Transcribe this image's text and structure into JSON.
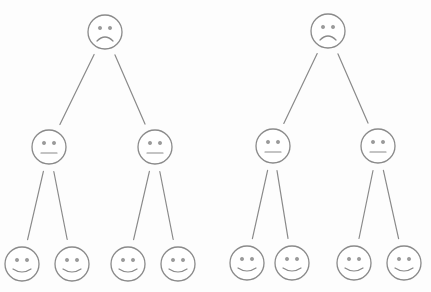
{
  "diagram": {
    "type": "tree",
    "colors": {
      "stroke": "#8a8a8a",
      "background": "#fdfdfd"
    },
    "face_radius": 17,
    "trees": [
      {
        "root": {
          "expression": "sad",
          "x": 105,
          "y": 32
        },
        "children": [
          {
            "expression": "neutral",
            "x": 49,
            "y": 147,
            "children": [
              {
                "expression": "happy",
                "x": 22,
                "y": 264
              },
              {
                "expression": "happy",
                "x": 72,
                "y": 264
              }
            ]
          },
          {
            "expression": "neutral",
            "x": 155,
            "y": 147,
            "children": [
              {
                "expression": "happy",
                "x": 128,
                "y": 264
              },
              {
                "expression": "happy",
                "x": 178,
                "y": 264
              }
            ]
          }
        ]
      },
      {
        "root": {
          "expression": "sad",
          "x": 328,
          "y": 31
        },
        "children": [
          {
            "expression": "neutral",
            "x": 273,
            "y": 146,
            "children": [
              {
                "expression": "happy",
                "x": 247,
                "y": 263
              },
              {
                "expression": "happy",
                "x": 292,
                "y": 263
              }
            ]
          },
          {
            "expression": "neutral",
            "x": 378,
            "y": 146,
            "children": [
              {
                "expression": "happy",
                "x": 354,
                "y": 263
              },
              {
                "expression": "happy",
                "x": 404,
                "y": 263
              }
            ]
          }
        ]
      }
    ]
  }
}
